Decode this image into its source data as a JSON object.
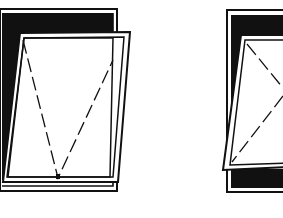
{
  "diagram": {
    "type": "technical-line-drawing",
    "figures": [
      {
        "id": "left",
        "description": "window sash tilted, hinged at bottom (dashed V toward bottom)",
        "opening_indicator": "dashed-v-bottom"
      },
      {
        "id": "right",
        "description": "window sash side-hung, hinged at left (dashed chevron toward left)",
        "opening_indicator": "dashed-v-left"
      }
    ],
    "colors": {
      "ink": "#111111",
      "paper": "#ffffff"
    }
  }
}
